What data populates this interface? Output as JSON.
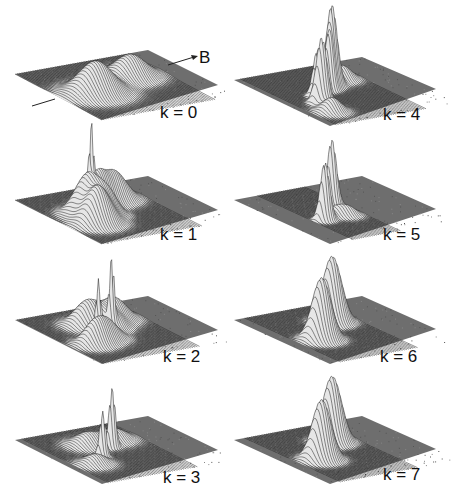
{
  "figure": {
    "type": "3d-surface-panels",
    "field_axis_label": "B",
    "background": "#ffffff",
    "plane_color": "#6e6e6e",
    "wire_color": "#1a1a1a",
    "peak_fill": "#e6e6e6"
  },
  "chart_data": {
    "type": "surface",
    "title": "",
    "annotations": [
      "B"
    ],
    "grid": "wireframe",
    "panels": [
      {
        "label": "k=0",
        "k": 0,
        "column": 0,
        "row": 0,
        "plane": {
          "left": [
            15,
            74
          ],
          "top": [
            148,
            50
          ],
          "right": [
            218,
            85
          ],
          "bottom": [
            102,
            120
          ]
        },
        "label_pos": [
          160,
          118
        ],
        "peaks": [
          {
            "u": 0.25,
            "v": 0.55,
            "h": 32,
            "w": 0.11
          },
          {
            "u": 0.62,
            "v": 0.38,
            "h": 22,
            "w": 0.1
          }
        ],
        "noise": 0.15
      },
      {
        "label": "k=1",
        "k": 1,
        "column": 0,
        "row": 1,
        "plane": {
          "left": [
            15,
            200
          ],
          "top": [
            148,
            176
          ],
          "right": [
            218,
            210
          ],
          "bottom": [
            102,
            244
          ]
        },
        "label_pos": [
          160,
          240
        ],
        "peaks": [
          {
            "u": 0.2,
            "v": 0.65,
            "h": 36,
            "w": 0.08
          },
          {
            "u": 0.25,
            "v": 0.45,
            "h": 38,
            "w": 0.08
          },
          {
            "u": 0.4,
            "v": 0.35,
            "h": 30,
            "w": 0.07
          },
          {
            "u": 0.55,
            "v": 0.3,
            "h": 28,
            "w": 0.08
          },
          {
            "u": 0.35,
            "v": 0.55,
            "h": 18,
            "w": 0.06
          },
          {
            "u": 0.3,
            "v": 0.42,
            "h": 55,
            "w": 0.012
          }
        ],
        "noise": 0.2
      },
      {
        "label": "k=2",
        "k": 2,
        "column": 0,
        "row": 2,
        "plane": {
          "left": [
            15,
            320
          ],
          "top": [
            148,
            296
          ],
          "right": [
            218,
            330
          ],
          "bottom": [
            102,
            364
          ]
        },
        "label_pos": [
          163,
          362
        ],
        "peaks": [
          {
            "u": 0.18,
            "v": 0.65,
            "h": 22,
            "w": 0.07
          },
          {
            "u": 0.35,
            "v": 0.3,
            "h": 24,
            "w": 0.08
          },
          {
            "u": 0.55,
            "v": 0.3,
            "h": 22,
            "w": 0.08
          },
          {
            "u": 0.3,
            "v": 0.6,
            "h": 18,
            "w": 0.07
          },
          {
            "u": 0.45,
            "v": 0.45,
            "h": 14,
            "w": 0.06
          },
          {
            "u": 0.3,
            "v": 0.5,
            "h": 48,
            "w": 0.015
          },
          {
            "u": 0.42,
            "v": 0.47,
            "h": 62,
            "w": 0.015
          }
        ],
        "noise": 0.2
      },
      {
        "label": "k=3",
        "k": 3,
        "column": 0,
        "row": 3,
        "plane": {
          "left": [
            15,
            440
          ],
          "top": [
            148,
            416
          ],
          "right": [
            218,
            450
          ],
          "bottom": [
            102,
            484
          ]
        },
        "label_pos": [
          163,
          483
        ],
        "peaks": [
          {
            "u": 0.18,
            "v": 0.65,
            "h": 10,
            "w": 0.07
          },
          {
            "u": 0.35,
            "v": 0.3,
            "h": 12,
            "w": 0.08
          },
          {
            "u": 0.55,
            "v": 0.3,
            "h": 11,
            "w": 0.08
          },
          {
            "u": 0.3,
            "v": 0.55,
            "h": 45,
            "w": 0.02
          },
          {
            "u": 0.45,
            "v": 0.43,
            "h": 58,
            "w": 0.02
          }
        ],
        "noise": 0.2
      },
      {
        "label": "k=4",
        "k": 4,
        "column": 1,
        "row": 0,
        "plane": {
          "left": [
            234,
            80
          ],
          "top": [
            362,
            57
          ],
          "right": [
            436,
            89
          ],
          "bottom": [
            330,
            126
          ]
        },
        "label_pos": [
          383,
          120
        ],
        "peaks": [
          {
            "u": 0.22,
            "v": 0.62,
            "h": 66,
            "w": 0.035
          },
          {
            "u": 0.28,
            "v": 0.5,
            "h": 48,
            "w": 0.03
          },
          {
            "u": 0.42,
            "v": 0.43,
            "h": 50,
            "w": 0.03
          },
          {
            "u": 0.48,
            "v": 0.38,
            "h": 80,
            "w": 0.035
          },
          {
            "u": 0.18,
            "v": 0.78,
            "h": 14,
            "w": 0.06
          },
          {
            "u": 0.62,
            "v": 0.3,
            "h": 14,
            "w": 0.06
          }
        ],
        "noise": 0.2
      },
      {
        "label": "k=5",
        "k": 5,
        "column": 1,
        "row": 1,
        "plane": {
          "left": [
            234,
            200
          ],
          "top": [
            362,
            176
          ],
          "right": [
            436,
            209
          ],
          "bottom": [
            330,
            244
          ]
        },
        "label_pos": [
          383,
          240
        ],
        "peaks": [
          {
            "u": 0.26,
            "v": 0.6,
            "h": 58,
            "w": 0.03
          },
          {
            "u": 0.48,
            "v": 0.38,
            "h": 66,
            "w": 0.03
          },
          {
            "u": 0.38,
            "v": 0.55,
            "h": 8,
            "w": 0.05
          },
          {
            "u": 0.45,
            "v": 0.6,
            "h": 8,
            "w": 0.05
          }
        ],
        "noise": 0.2
      },
      {
        "label": "k=6",
        "k": 6,
        "column": 1,
        "row": 2,
        "plane": {
          "left": [
            234,
            320
          ],
          "top": [
            362,
            296
          ],
          "right": [
            436,
            329
          ],
          "bottom": [
            330,
            364
          ]
        },
        "label_pos": [
          380,
          362
        ],
        "peaks": [
          {
            "u": 0.25,
            "v": 0.58,
            "h": 62,
            "w": 0.06
          },
          {
            "u": 0.52,
            "v": 0.33,
            "h": 66,
            "w": 0.06
          }
        ],
        "noise": 0.2
      },
      {
        "label": "k=7",
        "k": 7,
        "column": 1,
        "row": 3,
        "plane": {
          "left": [
            234,
            440
          ],
          "top": [
            362,
            416
          ],
          "right": [
            436,
            449
          ],
          "bottom": [
            330,
            484
          ]
        },
        "label_pos": [
          383,
          480
        ],
        "peaks": [
          {
            "u": 0.25,
            "v": 0.58,
            "h": 60,
            "w": 0.06
          },
          {
            "u": 0.52,
            "v": 0.33,
            "h": 66,
            "w": 0.06
          }
        ],
        "noise": 0.2
      }
    ]
  }
}
